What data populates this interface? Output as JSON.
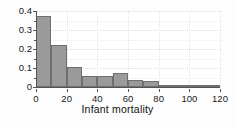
{
  "chart_data": {
    "type": "bar",
    "title": "",
    "subtitle": "",
    "xlabel": "Infant mortality",
    "ylabel": "",
    "xlim": [
      0,
      120
    ],
    "ylim": [
      0,
      0.4
    ],
    "grid": true,
    "legend": null,
    "bin_width": 10,
    "bar_fill": "#9a9a9a",
    "bar_edge": "#6f6f6f",
    "background": "#ffffff",
    "categories": [
      "0-10",
      "10-20",
      "20-30",
      "30-40",
      "40-50",
      "50-60",
      "60-70",
      "70-80",
      "80-90",
      "90-100",
      "100-110",
      "110-120"
    ],
    "bin_starts": [
      0,
      10,
      20,
      30,
      40,
      50,
      60,
      70,
      80,
      90,
      100,
      110
    ],
    "values": [
      0.372,
      0.222,
      0.104,
      0.06,
      0.06,
      0.072,
      0.035,
      0.03,
      0.004,
      0.013,
      0.01,
      0.004
    ],
    "xticks": [
      0,
      20,
      40,
      60,
      80,
      100,
      120
    ],
    "xticklabels": [
      "0",
      "20",
      "40",
      "60",
      "80",
      "100",
      "120"
    ],
    "yticks": [
      0,
      0.1,
      0.2,
      0.3,
      0.4
    ],
    "yticklabels": [
      "0",
      "0.1",
      "0.2",
      "0.3",
      "0.4"
    ]
  }
}
